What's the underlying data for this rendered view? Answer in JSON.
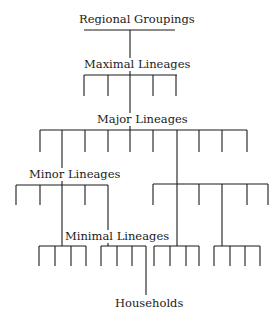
{
  "diagram": {
    "type": "segmentary lineage tree",
    "labels": {
      "regional": "Regional Groupings",
      "maximal": "Maximal Lineages",
      "major": "Major Lineages",
      "minor": "Minor Lineages",
      "minimal": "Minimal Lineages",
      "households": "Households"
    },
    "levels": [
      "Regional Groupings",
      "Maximal Lineages",
      "Major Lineages",
      "Minor Lineages",
      "Minimal Lineages",
      "Households"
    ]
  }
}
